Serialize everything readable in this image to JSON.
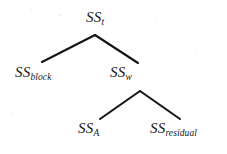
{
  "figure": {
    "kind": "tree-diagram",
    "background_color": "#ffffff",
    "ink_color": "#151515"
  },
  "nodes": [
    {
      "id": "total",
      "base": "SS",
      "subscript": "t",
      "full_label": "SS_t",
      "level": 0,
      "x": 103,
      "y": 18
    },
    {
      "id": "block",
      "base": "SS",
      "subscript": "block",
      "full_label": "SS_block",
      "level": 1,
      "x": 39,
      "y": 73
    },
    {
      "id": "within",
      "base": "SS",
      "subscript": "w",
      "full_label": "SS_w",
      "level": 1,
      "x": 140,
      "y": 73
    },
    {
      "id": "a",
      "base": "SS",
      "subscript": "A",
      "full_label": "SS_A",
      "level": 2,
      "x": 92,
      "y": 129
    },
    {
      "id": "residual",
      "base": "SS",
      "subscript": "residual",
      "full_label": "SS_residual",
      "level": 2,
      "x": 183,
      "y": 129
    }
  ],
  "edges": [
    {
      "id": "total-block",
      "from": "total",
      "to": "block",
      "x1": 95,
      "y1": 35,
      "x2": 42,
      "y2": 62
    },
    {
      "id": "total-within",
      "from": "total",
      "to": "within",
      "x1": 95,
      "y1": 35,
      "x2": 138,
      "y2": 63
    },
    {
      "id": "within-a",
      "from": "within",
      "to": "a",
      "x1": 140,
      "y1": 91,
      "x2": 100,
      "y2": 119
    },
    {
      "id": "within-residual",
      "from": "within",
      "to": "residual",
      "x1": 140,
      "y1": 91,
      "x2": 180,
      "y2": 119
    }
  ]
}
